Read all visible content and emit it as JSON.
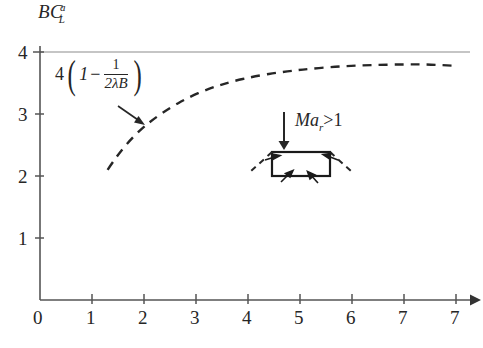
{
  "figure": {
    "background": "#ffffff",
    "ink_color": "#262626",
    "axis_color": "#555555"
  },
  "axes": {
    "x": {
      "label": "",
      "ticks": [
        "0",
        "1",
        "2",
        "3",
        "4",
        "5",
        "6",
        "7"
      ],
      "min": 0,
      "max": 7,
      "has_arrow": true
    },
    "y": {
      "label_base": "BC",
      "label_superscript": "a",
      "label_subscript": "L",
      "ticks": [
        "1",
        "2",
        "3",
        "4"
      ],
      "min": 0,
      "max": 4,
      "has_arrow": false
    }
  },
  "annotations": {
    "formula": {
      "leading_coefficient": "4",
      "open_paren": "(",
      "one": "1",
      "minus": "−",
      "fraction_numerator": "1",
      "fraction_denominator": "2λB",
      "close_paren": ")",
      "plain_text": "4(1 − 1/(2λB))",
      "points_to": "asymptote-curve"
    },
    "mach": {
      "symbol": "Ma",
      "subscript": "r",
      "relation": ">",
      "value": "1",
      "plain_text": "Ma_r > 1"
    },
    "inset": {
      "name": "shock-wave-diagram",
      "description": "rectangle with dashed oblique shock lines at corners and inward arrows"
    }
  },
  "chart_data": {
    "type": "line",
    "title": "",
    "xlabel": "",
    "ylabel": "BC_L^a",
    "xlim": [
      0,
      7
    ],
    "ylim": [
      0,
      4
    ],
    "grid": false,
    "legend": "none",
    "series": [
      {
        "name": "asymptote",
        "style": "solid",
        "color": "#8c8c8c",
        "x": [
          0,
          7
        ],
        "values": [
          4,
          4
        ]
      },
      {
        "name": "4(1 - 1/(2λB))",
        "style": "dashed",
        "color": "#262626",
        "x": [
          1.1,
          1.25,
          1.45,
          1.65,
          1.85,
          2.1,
          2.4,
          2.75,
          3.1,
          3.5,
          3.95,
          4.4,
          4.9,
          5.4,
          5.9,
          6.3,
          6.7
        ],
        "values": [
          2.1,
          2.32,
          2.56,
          2.76,
          2.92,
          3.09,
          3.26,
          3.41,
          3.52,
          3.61,
          3.68,
          3.73,
          3.77,
          3.79,
          3.8,
          3.8,
          3.78
        ]
      }
    ]
  }
}
